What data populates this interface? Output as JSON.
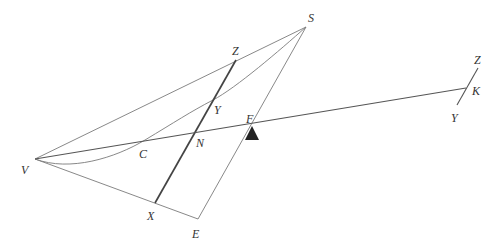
{
  "diagram": {
    "type": "geometric-construction",
    "points": {
      "S": "S",
      "Z": "Z",
      "Y": "Y",
      "F": "F",
      "C": "C",
      "N": "N",
      "V": "V",
      "X": "X",
      "E": "E",
      "Z2": "Z",
      "K": "K",
      "Y2": "Y"
    },
    "segments": [
      "VS",
      "SE",
      "VE",
      "ZX",
      "VK",
      "Z2Y2"
    ],
    "curves": [
      "V-C-Y-S"
    ],
    "markers": [
      {
        "name": "fulcrum",
        "at": "F",
        "shape": "triangle"
      }
    ],
    "colors": {
      "line": "#7a7a7a",
      "bold_line": "#444444",
      "fulcrum": "#222222",
      "label": "#333333"
    }
  }
}
